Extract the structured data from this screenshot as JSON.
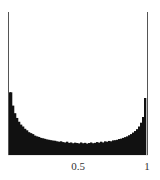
{
  "chart_data": {
    "type": "bar",
    "title": "",
    "xlabel": "",
    "ylabel": "",
    "xlim": [
      0,
      1
    ],
    "grid": false,
    "legend": null,
    "x_ticks": [
      {
        "value": 0.5,
        "label": "0.5"
      },
      {
        "value": 1,
        "label": "1"
      }
    ],
    "bin_count": 70,
    "edge_spike_value": 7.5,
    "values": [
      7.5,
      3.3,
      2.6,
      2.2,
      1.95,
      1.75,
      1.6,
      1.5,
      1.38,
      1.3,
      1.2,
      1.15,
      1.1,
      1.02,
      0.98,
      0.95,
      0.9,
      0.88,
      0.85,
      0.82,
      0.8,
      0.78,
      0.76,
      0.75,
      0.72,
      0.7,
      0.72,
      0.68,
      0.66,
      0.7,
      0.64,
      0.66,
      0.62,
      0.65,
      0.63,
      0.61,
      0.66,
      0.62,
      0.64,
      0.6,
      0.63,
      0.66,
      0.62,
      0.64,
      0.68,
      0.65,
      0.7,
      0.66,
      0.72,
      0.7,
      0.74,
      0.72,
      0.77,
      0.78,
      0.8,
      0.84,
      0.86,
      0.9,
      0.94,
      0.98,
      1.04,
      1.1,
      1.18,
      1.26,
      1.36,
      1.5,
      1.7,
      2.0,
      3.0,
      7.5
    ],
    "bar_color": "#111111"
  },
  "axis": {
    "tick_0_5": "0.5",
    "tick_1": "1"
  }
}
